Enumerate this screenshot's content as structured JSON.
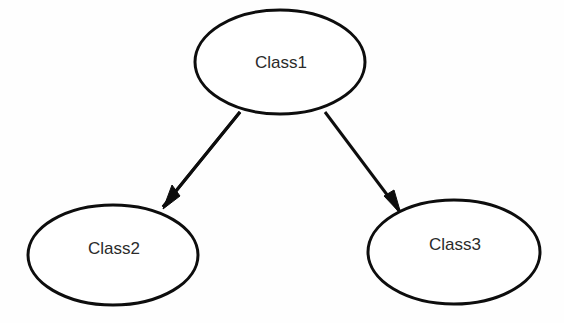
{
  "diagram": {
    "type": "class-inheritance-tree",
    "background_color": "#fefefe",
    "stroke_color": "#0d0d0d",
    "label_color": "#2b2b2b",
    "nodes": [
      {
        "id": "class1",
        "label": "Class1",
        "shape": "ellipse",
        "cx": 280,
        "cy": 62,
        "rx": 85,
        "ry": 52,
        "label_x": 281,
        "label_y": 64
      },
      {
        "id": "class2",
        "label": "Class2",
        "shape": "ellipse",
        "cx": 113,
        "cy": 255,
        "rx": 85,
        "ry": 50,
        "label_x": 114,
        "label_y": 250
      },
      {
        "id": "class3",
        "label": "Class3",
        "shape": "ellipse",
        "cx": 454,
        "cy": 252,
        "rx": 86,
        "ry": 52,
        "label_x": 455,
        "label_y": 246
      }
    ],
    "edges": [
      {
        "id": "edge-class1-class2",
        "from": "class1",
        "to": "class2",
        "style": "solid",
        "arrowhead": "filled-triangle",
        "x1": 240,
        "y1": 112,
        "x2": 163,
        "y2": 207,
        "head_points": "163,209 172,185 180,196"
      },
      {
        "id": "edge-class1-class3",
        "from": "class1",
        "to": "class3",
        "style": "solid",
        "arrowhead": "filled-triangle",
        "x1": 325,
        "y1": 112,
        "x2": 400,
        "y2": 212,
        "head_points": "401,214 384,196 394,190"
      }
    ]
  }
}
